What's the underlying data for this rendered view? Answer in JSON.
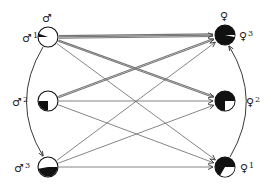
{
  "diagram": {
    "title": "",
    "males": [
      {
        "id": "m1",
        "symbol": "♂",
        "index": "1",
        "header_symbol": "♂",
        "cx": 48,
        "cy": 37,
        "fill": "white",
        "slice": {
          "start": 180,
          "end": 200,
          "color": "black"
        }
      },
      {
        "id": "m2",
        "symbol": "♂",
        "index": "2",
        "cx": 48,
        "cy": 101,
        "fill": "white",
        "slice": {
          "start": 90,
          "end": 180,
          "color": "black"
        }
      },
      {
        "id": "m3",
        "symbol": "♂",
        "index": "3",
        "cx": 48,
        "cy": 167,
        "fill": "white",
        "slice": {
          "start": 0,
          "end": 170,
          "color": "black"
        }
      }
    ],
    "females": [
      {
        "id": "f3",
        "symbol": "♀",
        "index": "3",
        "header_symbol": "♀",
        "cx": 225,
        "cy": 35,
        "fill": "black",
        "slice": {
          "start": 0,
          "end": 12,
          "color": "white"
        }
      },
      {
        "id": "f2",
        "symbol": "♀",
        "index": "2",
        "cx": 225,
        "cy": 101,
        "fill": "black",
        "slice": {
          "start": 0,
          "end": 90,
          "color": "white"
        }
      },
      {
        "id": "f1",
        "symbol": "♀",
        "index": "1",
        "cx": 225,
        "cy": 167,
        "fill": "black",
        "slice": {
          "start": 0,
          "end": 120,
          "color": "white"
        }
      }
    ],
    "edges": [
      {
        "from": "m1",
        "to": "f3",
        "weight": 3
      },
      {
        "from": "m1",
        "to": "f2",
        "weight": 2
      },
      {
        "from": "m1",
        "to": "f1",
        "weight": 1
      },
      {
        "from": "m2",
        "to": "f3",
        "weight": 2
      },
      {
        "from": "m2",
        "to": "f2",
        "weight": 1
      },
      {
        "from": "m2",
        "to": "f1",
        "weight": 1
      },
      {
        "from": "m3",
        "to": "f3",
        "weight": 1
      },
      {
        "from": "m3",
        "to": "f2",
        "weight": 1
      },
      {
        "from": "m3",
        "to": "f1",
        "weight": 1
      }
    ],
    "curves": [
      {
        "from": "m1",
        "to": "m3",
        "side": "left"
      },
      {
        "from": "f1",
        "to": "f3",
        "side": "right"
      }
    ],
    "colors": {
      "line": "#777777",
      "thin_line": "#666666",
      "ink": "#111111"
    }
  }
}
